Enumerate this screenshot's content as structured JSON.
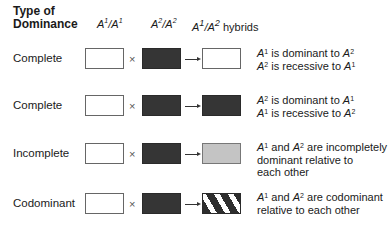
{
  "header": {
    "type_label_line1": "Type of",
    "type_label_line2": "Dominance",
    "col_a1a1": {
      "base": "A",
      "sup1": "1",
      "sep": "/",
      "sup2": "1"
    },
    "col_a2a2": {
      "base": "A",
      "sup1": "2",
      "sep": "/",
      "sup2": "2"
    },
    "col_hybrid": {
      "base": "A",
      "sup1": "1",
      "sep": "/",
      "sup2": "2",
      "suffix": " hybrids"
    }
  },
  "symbols": {
    "cross": "×"
  },
  "rows": [
    {
      "type": "Complete",
      "hybrid_fill": "white",
      "desc": [
        "A¹ is dominant to A²",
        "A² is recessive to A¹"
      ]
    },
    {
      "type": "Complete",
      "hybrid_fill": "dark",
      "desc": [
        "A² is dominant to A¹",
        "A¹ is recessive to A²"
      ]
    },
    {
      "type": "Incomplete",
      "hybrid_fill": "gray",
      "desc": [
        "A¹ and A² are incompletely",
        "dominant relative to",
        "each other"
      ]
    },
    {
      "type": "Codominant",
      "hybrid_fill": "striped",
      "desc": [
        "A¹ and A² are codominant",
        "relative to each other"
      ]
    }
  ],
  "colors": {
    "dark": "#353535",
    "gray": "#c4c4c4",
    "white": "#ffffff"
  }
}
